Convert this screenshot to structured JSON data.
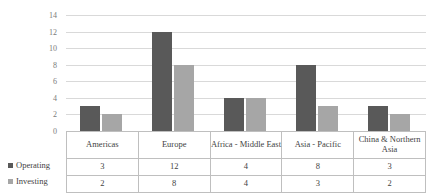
{
  "chart_data": {
    "type": "bar",
    "title": "",
    "xlabel": "",
    "ylabel": "",
    "ylim": [
      0,
      14
    ],
    "yticks": [
      14,
      12,
      10,
      8,
      6,
      4,
      2,
      0
    ],
    "grid": true,
    "legend_position": "left-table",
    "categories": [
      "Americas",
      "Europe",
      "Africa - Middle East",
      "Asia - Pacific",
      "China & Northern Asia"
    ],
    "series": [
      {
        "name": "Operating",
        "color": "#595959",
        "values": [
          3,
          12,
          4,
          8,
          3
        ]
      },
      {
        "name": "Investing",
        "color": "#a6a6a6",
        "values": [
          2,
          8,
          4,
          3,
          2
        ]
      }
    ]
  },
  "table": {
    "category_row": [
      "Americas",
      "Europe",
      "Africa - Middle East",
      "Asia - Pacific",
      "China & Northern Asia"
    ],
    "rows": [
      {
        "label": "Operating",
        "values": [
          "3",
          "12",
          "4",
          "8",
          "3"
        ]
      },
      {
        "label": "Investing",
        "values": [
          "2",
          "8",
          "4",
          "3",
          "2"
        ]
      }
    ]
  },
  "colors": {
    "operating": "#595959",
    "investing": "#a6a6a6",
    "gridline": "#d9d9d9",
    "border": "#bfbfbf",
    "text": "#3f3f3f",
    "axis_text": "#7a7a7a"
  }
}
